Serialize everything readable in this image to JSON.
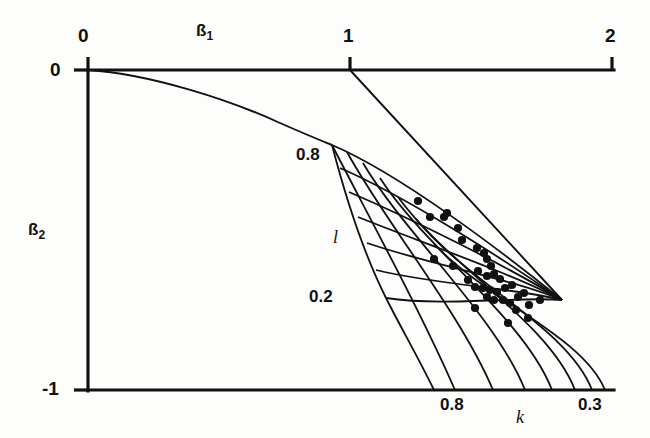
{
  "figure": {
    "background_color": "#fdfdfb",
    "ink_color": "#111111"
  },
  "axes": {
    "top": {
      "name_base": "ß",
      "name_sub": "1",
      "ticks": [
        {
          "label": "0",
          "x": 88
        },
        {
          "label": "1",
          "x": 350
        },
        {
          "label": "2",
          "x": 612
        }
      ],
      "range": [
        0,
        2
      ]
    },
    "left": {
      "name_base": "ß",
      "name_sub": "2",
      "ticks": [
        {
          "label": "0",
          "y": 70
        },
        {
          "label": "-1",
          "y": 390
        }
      ],
      "range": [
        -1,
        0
      ]
    },
    "bottom_nomogram": {
      "name": "k",
      "ticks": [
        {
          "label": "0.8",
          "x": 455
        },
        {
          "label": "0.3",
          "x": 592
        }
      ]
    },
    "left_nomogram": {
      "name": "l",
      "ticks": [
        {
          "label": "0.8",
          "y": 155
        },
        {
          "label": "0.2",
          "y": 297
        }
      ]
    }
  },
  "chart_data": {
    "type": "scatter",
    "title": "",
    "xlabel": "ß1",
    "ylabel": "ß2",
    "xlim": [
      0,
      2
    ],
    "ylim": [
      -1,
      0
    ],
    "grid": false,
    "legend": null,
    "annotations": [
      {
        "text": "ß1",
        "role": "top-axis-name"
      },
      {
        "text": "ß2",
        "role": "left-axis-name"
      },
      {
        "text": "k",
        "role": "nomogram-parameter-bottom"
      },
      {
        "text": "l",
        "role": "nomogram-parameter-left"
      },
      {
        "text": "0.8",
        "role": "l-grid-upper"
      },
      {
        "text": "0.2",
        "role": "l-grid-lower"
      },
      {
        "text": "0.8",
        "role": "k-grid-left"
      },
      {
        "text": "0.3",
        "role": "k-grid-right"
      }
    ],
    "xtick_labels": [
      "0",
      "1",
      "2"
    ],
    "ytick_labels": [
      "0",
      "-1"
    ],
    "nomogram": {
      "description": "Curvilinear grid (nomogram) of parameters k and l overlaid on the ß1-ß2 plane",
      "k_values": [
        0.8,
        0.7,
        0.6,
        0.5,
        0.4,
        0.35,
        0.3
      ],
      "l_values": [
        0.8,
        0.7,
        0.6,
        0.5,
        0.4,
        0.3,
        0.2
      ],
      "convergence_point": [
        562,
        300
      ],
      "boundary_curve_label": "stability boundary from origin"
    },
    "points": [
      {
        "px": 418,
        "py": 201,
        "b1": 1.49,
        "b2": -0.41
      },
      {
        "px": 430,
        "py": 217,
        "b1": 1.56,
        "b2": -0.46
      },
      {
        "px": 444,
        "py": 217,
        "b1": 1.64,
        "b2": -0.46
      },
      {
        "px": 447,
        "py": 213,
        "b1": 1.66,
        "b2": -0.45
      },
      {
        "px": 458,
        "py": 228,
        "b1": 1.7,
        "b2": -0.49
      },
      {
        "px": 462,
        "py": 240,
        "b1": 1.73,
        "b2": -0.53
      },
      {
        "px": 434,
        "py": 259,
        "b1": 1.57,
        "b2": -0.59
      },
      {
        "px": 453,
        "py": 266,
        "b1": 1.68,
        "b2": -0.61
      },
      {
        "px": 477,
        "py": 248,
        "b1": 1.81,
        "b2": -0.56
      },
      {
        "px": 484,
        "py": 253,
        "b1": 1.85,
        "b2": -0.57
      },
      {
        "px": 487,
        "py": 259,
        "b1": 1.87,
        "b2": -0.59
      },
      {
        "px": 491,
        "py": 266,
        "b1": 1.89,
        "b2": -0.61
      },
      {
        "px": 478,
        "py": 271,
        "b1": 1.82,
        "b2": -0.63
      },
      {
        "px": 487,
        "py": 276,
        "b1": 1.87,
        "b2": -0.64
      },
      {
        "px": 494,
        "py": 274,
        "b1": 1.9,
        "b2": -0.64
      },
      {
        "px": 500,
        "py": 279,
        "b1": 1.94,
        "b2": -0.65
      },
      {
        "px": 468,
        "py": 280,
        "b1": 1.76,
        "b2": -0.66
      },
      {
        "px": 475,
        "py": 287,
        "b1": 1.8,
        "b2": -0.68
      },
      {
        "px": 483,
        "py": 288,
        "b1": 1.84,
        "b2": -0.68
      },
      {
        "px": 490,
        "py": 290,
        "b1": 1.88,
        "b2": -0.69
      },
      {
        "px": 497,
        "py": 292,
        "b1": 1.92,
        "b2": -0.69
      },
      {
        "px": 505,
        "py": 288,
        "b1": 1.97,
        "b2": -0.68
      },
      {
        "px": 512,
        "py": 285,
        "b1": 2.0,
        "b2": -0.67
      },
      {
        "px": 487,
        "py": 297,
        "b1": 1.87,
        "b2": -0.71
      },
      {
        "px": 494,
        "py": 300,
        "b1": 1.9,
        "b2": -0.72
      },
      {
        "px": 503,
        "py": 300,
        "b1": 1.95,
        "b2": -0.72
      },
      {
        "px": 510,
        "py": 303,
        "b1": 1.99,
        "b2": -0.73
      },
      {
        "px": 518,
        "py": 297,
        "b1": 2.03,
        "b2": -0.71
      },
      {
        "px": 524,
        "py": 293,
        "b1": 2.07,
        "b2": -0.7
      },
      {
        "px": 475,
        "py": 308,
        "b1": 1.8,
        "b2": -0.74
      },
      {
        "px": 516,
        "py": 310,
        "b1": 2.02,
        "b2": -0.75
      },
      {
        "px": 529,
        "py": 305,
        "b1": 2.09,
        "b2": -0.73
      },
      {
        "px": 540,
        "py": 300,
        "b1": 2.15,
        "b2": -0.72
      },
      {
        "px": 528,
        "py": 318,
        "b1": 2.08,
        "b2": -0.78
      },
      {
        "px": 508,
        "py": 323,
        "b1": 1.98,
        "b2": -0.79
      }
    ]
  }
}
